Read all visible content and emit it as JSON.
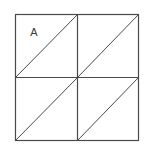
{
  "figure": {
    "name": "square-divided-into-four-quadrants-with-diagonals",
    "background_color": "#ffffff",
    "line_color": "#4a4a4a",
    "label_color": "#3a3a3a",
    "stroke_width": 1,
    "outer_square": {
      "x": 15,
      "y": 14,
      "width": 124,
      "height": 127
    },
    "midlines": {
      "vertical_x": 77,
      "horizontal_y": 77.5
    },
    "labels": [
      {
        "id": "region-label-a",
        "text": "A",
        "x": 34,
        "y": 36,
        "font_size": 11,
        "region": "upper-left-triangle-of-top-left-quadrant"
      }
    ],
    "quadrants": [
      {
        "id": "top-left",
        "x": 15,
        "y": 14,
        "width": 62,
        "height": 63.5,
        "diagonal": "bottom-left-to-top-right"
      },
      {
        "id": "top-right",
        "x": 77,
        "y": 14,
        "width": 62,
        "height": 63.5,
        "diagonal": "bottom-left-to-top-right"
      },
      {
        "id": "bottom-left",
        "x": 15,
        "y": 77.5,
        "width": 62,
        "height": 63.5,
        "diagonal": "bottom-left-to-top-right"
      },
      {
        "id": "bottom-right",
        "x": 77,
        "y": 77.5,
        "width": 62,
        "height": 63.5,
        "diagonal": "bottom-left-to-top-right"
      }
    ]
  }
}
